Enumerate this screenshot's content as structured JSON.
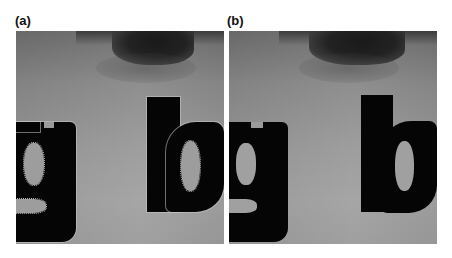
{
  "figure": {
    "panels": [
      {
        "id": "a",
        "label": "(a)",
        "description": "Grayscale close-up of face region below an eye with overlaid black letters 'g' and 'b'; letter edges show light halo artifacts"
      },
      {
        "id": "b",
        "label": "(b)",
        "description": "Same face region with overlaid black letters 'g' and 'b'; clean letter edges without halo artifacts"
      }
    ],
    "overlay_text": "gb"
  }
}
